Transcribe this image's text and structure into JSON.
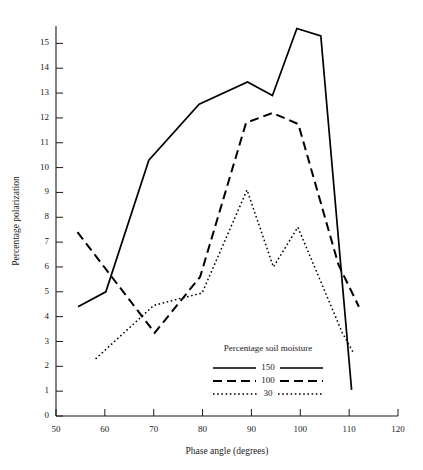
{
  "chart_data": {
    "type": "line",
    "title": "",
    "xlabel": "Phase angle (degrees)",
    "ylabel": "Percentage polarization",
    "xlim": [
      50,
      120
    ],
    "ylim": [
      0,
      15.7
    ],
    "xticks": [
      50,
      60,
      70,
      80,
      90,
      100,
      110,
      120
    ],
    "yticks": [
      0,
      1,
      2,
      3,
      4,
      5,
      6,
      7,
      8,
      9,
      10,
      11,
      12,
      13,
      14,
      15
    ],
    "grid": false,
    "legend_position": "inside-lower-right",
    "legend_title": "Percentage soil moisture",
    "series": [
      {
        "name": "150",
        "style": "solid",
        "color": "#000000",
        "points": [
          [
            54.5,
            4.4
          ],
          [
            60.2,
            5.0
          ],
          [
            69.0,
            10.3
          ],
          [
            79.3,
            12.55
          ],
          [
            89.2,
            13.45
          ],
          [
            94.3,
            12.9
          ],
          [
            99.3,
            15.6
          ],
          [
            104.2,
            15.3
          ],
          [
            110.5,
            1.05
          ]
        ]
      },
      {
        "name": "100",
        "style": "dashed",
        "color": "#000000",
        "points": [
          [
            54.4,
            7.4
          ],
          [
            70.2,
            3.35
          ],
          [
            79.5,
            5.6
          ],
          [
            88.9,
            11.8
          ],
          [
            94.3,
            12.2
          ],
          [
            99.6,
            11.75
          ],
          [
            107.8,
            6.1
          ],
          [
            112.0,
            4.4
          ]
        ]
      },
      {
        "name": "30",
        "style": "dotted",
        "color": "#000000",
        "points": [
          [
            58.1,
            2.3
          ],
          [
            70.0,
            4.45
          ],
          [
            74.8,
            4.7
          ],
          [
            79.9,
            4.95
          ],
          [
            89.1,
            9.1
          ],
          [
            94.5,
            6.0
          ],
          [
            99.5,
            7.6
          ],
          [
            108.6,
            3.35
          ],
          [
            111.0,
            2.5
          ]
        ]
      }
    ]
  },
  "legend": {
    "title": "Percentage soil moisture",
    "items": [
      {
        "label": "150",
        "style": "solid"
      },
      {
        "label": "100",
        "style": "dashed"
      },
      {
        "label": "30",
        "style": "dotted"
      }
    ]
  },
  "axes": {
    "x_title": "Phase angle (degrees)",
    "y_title": "Percentage polarization"
  }
}
